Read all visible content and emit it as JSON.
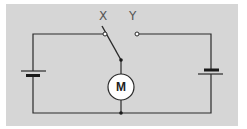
{
  "diagram": {
    "type": "circuit",
    "background_color": "#ffffff",
    "panel_color": "#d6d6d6",
    "wire_color": "#2a2a2a",
    "components": {
      "switch": {
        "terminals": [
          {
            "label": "X"
          },
          {
            "label": "Y"
          }
        ],
        "position": "X"
      },
      "motor": {
        "label": "M"
      },
      "batteries": [
        {
          "side": "left"
        },
        {
          "side": "right"
        }
      ]
    }
  }
}
